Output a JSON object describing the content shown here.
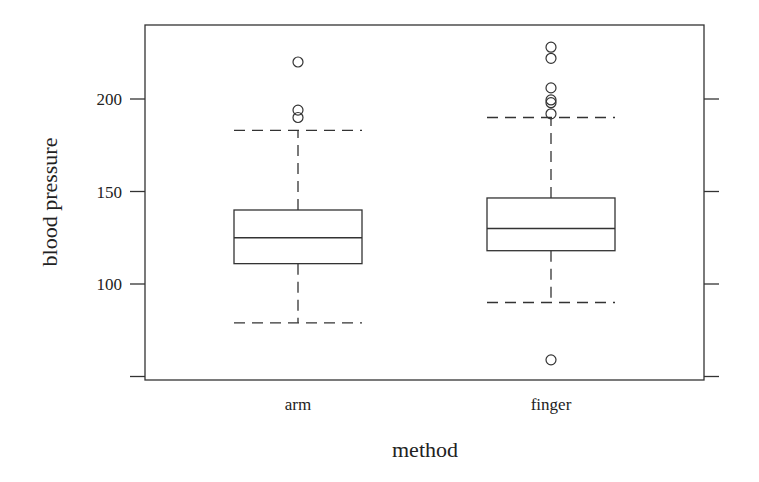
{
  "chart_data": {
    "type": "boxplot",
    "title": "",
    "xlabel": "method",
    "ylabel": "blood pressure",
    "categories": [
      "arm",
      "finger"
    ],
    "y_ticks": [
      50,
      100,
      150,
      200
    ],
    "y_tick_labels": [
      "",
      "100",
      "150",
      "200"
    ],
    "ylim": [
      45,
      237
    ],
    "grid": false,
    "legend": null,
    "series": [
      {
        "name": "arm",
        "whisker_low": 79,
        "q1": 111,
        "median": 125,
        "q3": 140,
        "whisker_high": 183,
        "outliers": [
          190,
          194,
          220
        ]
      },
      {
        "name": "finger",
        "whisker_low": 90,
        "q1": 118,
        "median": 130,
        "q3": 146.5,
        "whisker_high": 190,
        "outliers": [
          59,
          192,
          198,
          199.5,
          206,
          222,
          228
        ]
      }
    ]
  },
  "colors": {
    "line": "#333333",
    "background": "#ffffff"
  }
}
